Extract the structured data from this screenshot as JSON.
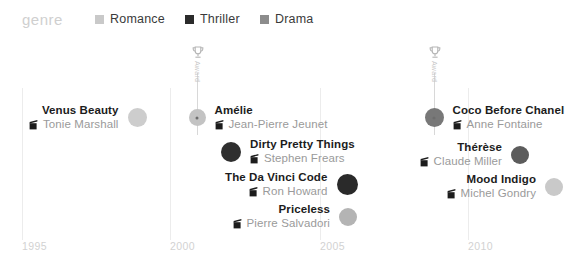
{
  "legend": {
    "title": "genre",
    "entries": [
      {
        "label": "Romance",
        "color": "#c9c9c9",
        "x": 95
      },
      {
        "label": "Thriller",
        "color": "#2b2b2b",
        "x": 185
      },
      {
        "label": "Drama",
        "color": "#8c8c8c",
        "x": 260
      }
    ]
  },
  "axis": {
    "ticks": [
      {
        "label": "1995",
        "x": 22
      },
      {
        "label": "2000",
        "x": 170
      },
      {
        "label": "2005",
        "x": 320
      },
      {
        "label": "2010",
        "x": 468
      }
    ]
  },
  "awards": [
    {
      "text": "Award",
      "x": 191,
      "y": 45,
      "stem_height": 62
    },
    {
      "text": "Award",
      "x": 428,
      "y": 45,
      "stem_height": 62
    }
  ],
  "icons": {
    "slate": "clapperboard-icon",
    "trophy": "trophy-icon"
  },
  "chart_data": {
    "type": "scatter",
    "title": "",
    "xlabel": "",
    "ylabel": "",
    "xlim": [
      1995,
      2012
    ],
    "grid": true,
    "legend_position": "top",
    "legend_title": "genre",
    "categories": [
      "Romance",
      "Thriller",
      "Drama"
    ],
    "category_colors": {
      "Romance": "#c9c9c9",
      "Thriller": "#2b2b2b",
      "Drama": "#8c8c8c"
    },
    "xtick_labels": [
      "1995",
      "2000",
      "2005",
      "2010"
    ],
    "points": [
      {
        "title": "Venus Beauty",
        "director": "Tonie Marshall",
        "genre": "Romance",
        "color": "#cdcdcd",
        "size": 19,
        "label_side": "left",
        "x": 137,
        "y": 118,
        "highlighted": false
      },
      {
        "title": "Amélie",
        "director": "Jean-Pierre Jeunet",
        "genre": "Romance",
        "color": "#c3c3c3",
        "size": 17,
        "label_side": "right",
        "x": 197,
        "y": 118,
        "highlighted": true
      },
      {
        "title": "Dirty Pretty Things",
        "director": "Stephen Frears",
        "genre": "Thriller",
        "color": "#2f2f2f",
        "size": 20,
        "label_side": "right",
        "x": 231,
        "y": 152,
        "highlighted": false
      },
      {
        "title": "The Da Vinci Code",
        "director": "Ron Howard",
        "genre": "Thriller",
        "color": "#2a2a2a",
        "size": 21,
        "label_side": "left",
        "x": 347,
        "y": 185,
        "highlighted": false
      },
      {
        "title": "Priceless",
        "director": "Pierre Salvadori",
        "genre": "Drama",
        "color": "#b4b4b4",
        "size": 18,
        "label_side": "left",
        "x": 348,
        "y": 217,
        "highlighted": false
      },
      {
        "title": "Coco Before Chanel",
        "director": "Anne Fontaine",
        "genre": "Drama",
        "color": "#787878",
        "size": 19,
        "label_side": "right",
        "x": 434,
        "y": 118,
        "highlighted": true
      },
      {
        "title": "Thérèse",
        "director": "Claude Miller",
        "genre": "Drama",
        "color": "#5c5c5c",
        "size": 18,
        "label_side": "left",
        "x": 520,
        "y": 155,
        "highlighted": false
      },
      {
        "title": "Mood Indigo",
        "director": "Michel Gondry",
        "genre": "Romance",
        "color": "#c9c9c9",
        "size": 18,
        "label_side": "left",
        "x": 554,
        "y": 187,
        "highlighted": false
      }
    ]
  }
}
